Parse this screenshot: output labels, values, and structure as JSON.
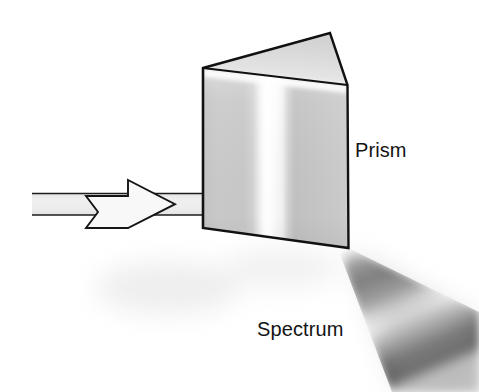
{
  "figure": {
    "background_color": "#ffffff",
    "width": 479,
    "height": 392
  },
  "labels": {
    "prism": "Prism",
    "spectrum": "Spectrum",
    "text_color": "#141414",
    "font_size_px": 20
  },
  "objects": {
    "prism": {
      "name": "Prism",
      "outline_color": "#111111",
      "front_face_fill": "#cfcfcf",
      "highlight_band_fill": "#fbfbfb",
      "top_face_fill": "#d8d8d8",
      "right_face_fill": "#b9b9b9",
      "front_face_points": "203,68 347,85 348,248 203,228",
      "top_face_points": "203,68 330,33 347,85",
      "right_face_points": "330,33 347,85 348,248",
      "highlight_x_start": 256,
      "highlight_x_end": 280
    },
    "incident_beam": {
      "name": "Incident white light beam",
      "fill": "#ebebeb",
      "outline_color": "#1a1a1a",
      "x_start": 32,
      "x_end": 204,
      "y_top": 193,
      "y_bottom": 215,
      "direction": "left-to-right"
    },
    "direction_arrow": {
      "name": "Beam direction arrow",
      "fill": "#f7f7f7",
      "outline_color": "#1a1a1a",
      "tip_x": 174,
      "tip_y": 204,
      "points": "86,196 127,196 127,181 174,204 127,227 86,227 97,211.5"
    },
    "spectrum": {
      "name": "Dispersed spectrum fan",
      "origin_x": 348,
      "origin_y": 248,
      "fan_points": "348,248 479,318 479,392 398,392 344,252",
      "dark_band_color": "#6a6a6a",
      "mid_band_color": "#9d9d9d",
      "light_band_color": "#e9e9e9",
      "bands": [
        {
          "name": "upper-edge-light",
          "tone": "#d6d6d6"
        },
        {
          "name": "upper-dark",
          "tone": "#7b7b7b"
        },
        {
          "name": "bright-center",
          "tone": "#efefef"
        },
        {
          "name": "lower-dark",
          "tone": "#5f5f5f"
        },
        {
          "name": "lower-edge-fade",
          "tone": "#b6b6b6"
        }
      ]
    },
    "ground_shadow": {
      "name": "Soft shadow under prism",
      "color": "#dcdcdc",
      "center_x": 160,
      "center_y": 290
    }
  }
}
